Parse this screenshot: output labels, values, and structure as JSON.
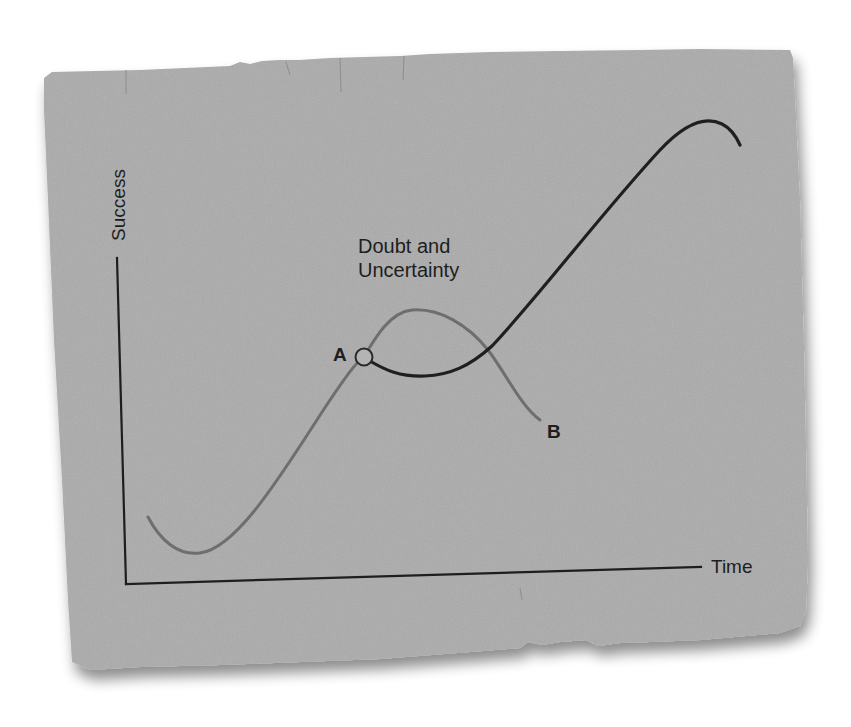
{
  "diagram": {
    "type": "conceptual-line-diagram",
    "axes": {
      "y_label": "Success",
      "x_label": "Time"
    },
    "annotation": {
      "line1": "Doubt and",
      "line2": "Uncertainty"
    },
    "points": {
      "a_label": "A",
      "b_label": "B"
    },
    "curves": [
      {
        "name": "initial-growth-and-decline",
        "color": "#6e6e6e",
        "description": "Rises from a low start to point A, peaks during doubt and uncertainty, then declines to point B"
      },
      {
        "name": "persevering-path",
        "color": "#1f1f1f",
        "description": "From point A dips during doubt and uncertainty, then rises steeply to a high peak"
      }
    ],
    "colors": {
      "card": "#ababab",
      "card_edge": "#9a9a9a",
      "background": "#ffffff",
      "ink": "#1e1e1e",
      "gray_curve": "#6e6e6e"
    }
  }
}
